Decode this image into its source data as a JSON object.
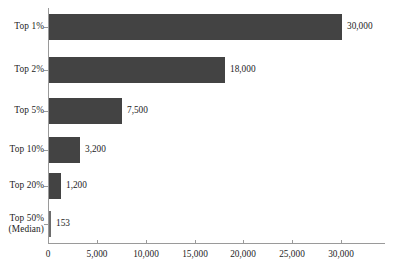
{
  "chart_data": {
    "type": "bar",
    "orientation": "horizontal",
    "title": "",
    "xlabel": "",
    "ylabel": "",
    "categories": [
      "Top 1%",
      "Top 2%",
      "Top 5%",
      "Top 10%",
      "Top 20%",
      "Top 50%\n(Median)"
    ],
    "values": [
      30000,
      18000,
      7500,
      3200,
      1200,
      153
    ],
    "value_labels": [
      "30,000",
      "18,000",
      "7,500",
      "3,200",
      "1,200",
      "153"
    ],
    "xlim": [
      0,
      34500
    ],
    "xticks": [
      0,
      5000,
      10000,
      15000,
      20000,
      25000,
      30000
    ],
    "xtick_labels": [
      "0",
      "5,000",
      "10,000",
      "15,000",
      "20,000",
      "25,000",
      "30,000"
    ],
    "grid": false,
    "legend": false,
    "bar_color": "#434343",
    "axis_color": "#9a9a9a",
    "text_color": "#1c1c1c"
  },
  "axis": {
    "ticks": [
      {
        "label": "0",
        "value": 0
      },
      {
        "label": "5,000",
        "value": 5000
      },
      {
        "label": "10,000",
        "value": 10000
      },
      {
        "label": "15,000",
        "value": 15000
      },
      {
        "label": "20,000",
        "value": 20000
      },
      {
        "label": "25,000",
        "value": 25000
      },
      {
        "label": "30,000",
        "value": 30000
      }
    ]
  },
  "rows": [
    {
      "label": "Top 1%",
      "value": 30000,
      "value_label": "30,000"
    },
    {
      "label": "Top 2%",
      "value": 18000,
      "value_label": "18,000"
    },
    {
      "label": "Top 5%",
      "value": 7500,
      "value_label": "7,500"
    },
    {
      "label": "Top 10%",
      "value": 3200,
      "value_label": "3,200"
    },
    {
      "label": "Top 20%",
      "value": 1200,
      "value_label": "1,200"
    },
    {
      "label": "Top 50%\n(Median)",
      "value": 153,
      "value_label": "153"
    }
  ]
}
